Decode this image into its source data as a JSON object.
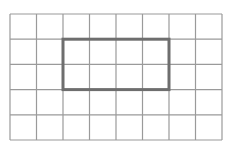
{
  "diagram": {
    "type": "grid-with-highlight-rectangle",
    "grid": {
      "columns": 8,
      "rows": 5,
      "origin_x": 10,
      "origin_y": 14,
      "width": 212,
      "height": 126,
      "line_color": "#9a9a9a",
      "line_width": 1.2
    },
    "highlight": {
      "col_start": 2,
      "row_start": 1,
      "col_span": 4,
      "row_span": 2,
      "stroke_color": "#6e6e6e",
      "stroke_width": 3
    },
    "background_color": "#ffffff"
  }
}
